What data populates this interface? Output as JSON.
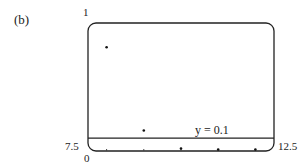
{
  "panel_label": "(b)",
  "chart_data": {
    "type": "scatter",
    "title": "",
    "xlabel": "",
    "ylabel": "",
    "xlim": [
      7.5,
      12.5
    ],
    "ylim": [
      0,
      1
    ],
    "grid": false,
    "x_tick_positions": [
      8,
      9,
      10,
      11,
      12
    ],
    "axis_labels": {
      "x_min": "7.5",
      "x_max": "12.5",
      "y_min": "0",
      "y_max": "1"
    },
    "series": [
      {
        "name": "points",
        "x": [
          8,
          9,
          10,
          11,
          12
        ],
        "y": [
          0.81,
          0.16,
          0.02,
          0.0,
          0.0
        ]
      }
    ],
    "reference_lines": [
      {
        "orientation": "horizontal",
        "y": 0.1,
        "label": "y = 0.1"
      }
    ]
  }
}
